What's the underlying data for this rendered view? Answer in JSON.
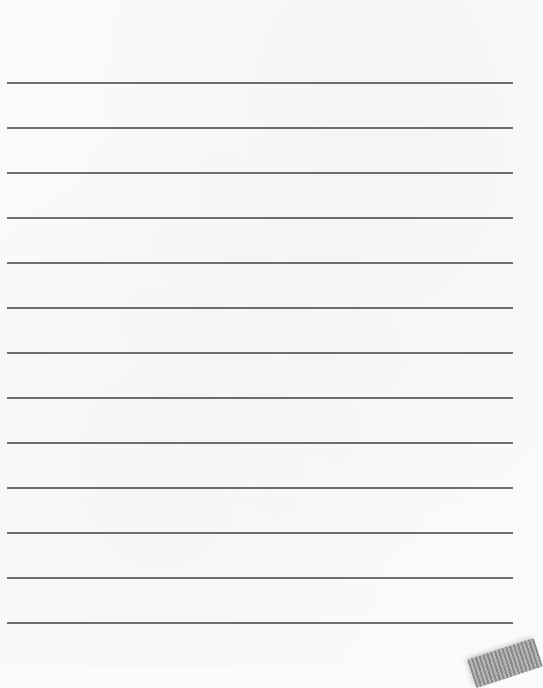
{
  "page": {
    "type": "lined-paper",
    "background_color": "#fafafa",
    "line_color": "#6e6e6e",
    "line_count": 13,
    "line_spacing_px": 45,
    "lines_y": [
      82,
      127,
      172,
      217,
      262,
      307,
      352,
      397,
      442,
      487,
      532,
      577,
      622
    ]
  }
}
